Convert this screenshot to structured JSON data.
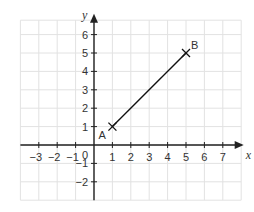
{
  "chart_data": {
    "type": "line",
    "title": "",
    "xlabel": "x",
    "ylabel": "y",
    "xlim": [
      -4,
      8
    ],
    "ylim": [
      -3,
      7
    ],
    "x_ticks": [
      -3,
      -2,
      -1,
      1,
      2,
      3,
      4,
      5,
      6,
      7
    ],
    "y_ticks": [
      -2,
      -1,
      1,
      2,
      3,
      4,
      5,
      6
    ],
    "origin_label": "0",
    "grid": true,
    "series": [
      {
        "name": "segment AB",
        "points": [
          {
            "label": "A",
            "x": 1,
            "y": 1
          },
          {
            "label": "B",
            "x": 5,
            "y": 5
          }
        ]
      }
    ]
  },
  "colors": {
    "grid": "#e2e2e2",
    "axis": "#222222",
    "line": "#111111"
  }
}
